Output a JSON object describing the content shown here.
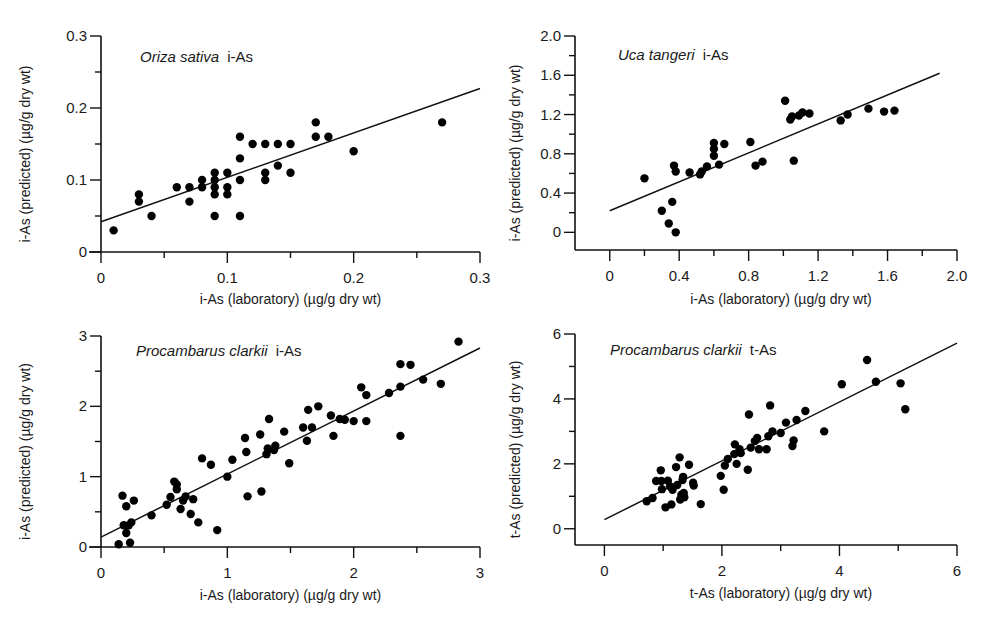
{
  "chart_data": [
    {
      "type": "scatter",
      "title": {
        "species": "Oriza sativa",
        "analyte": "i-As"
      },
      "xlabel": "i-As (laboratory) (µg/g dry wt)",
      "ylabel": "i-As  (predicted) (µg/g dry wt)",
      "xlim": [
        0,
        0.3
      ],
      "ylim": [
        0,
        0.3
      ],
      "xticks": [
        0,
        0.1,
        0.2,
        0.3
      ],
      "xtick_labels": [
        "0",
        "0.1",
        "0.2",
        "0.3"
      ],
      "xminor": [
        0.05,
        0.15,
        0.25
      ],
      "yticks": [
        0,
        0.1,
        0.2,
        0.3
      ],
      "ytick_labels": [
        "0",
        "0.1",
        "0.2",
        "0.3"
      ],
      "yminor": [
        0.05,
        0.15,
        0.25
      ],
      "grid": false,
      "points": [
        [
          0.01,
          0.03
        ],
        [
          0.03,
          0.08
        ],
        [
          0.03,
          0.07
        ],
        [
          0.04,
          0.05
        ],
        [
          0.06,
          0.09
        ],
        [
          0.07,
          0.09
        ],
        [
          0.07,
          0.07
        ],
        [
          0.08,
          0.1
        ],
        [
          0.08,
          0.09
        ],
        [
          0.09,
          0.11
        ],
        [
          0.09,
          0.1
        ],
        [
          0.09,
          0.09
        ],
        [
          0.09,
          0.08
        ],
        [
          0.09,
          0.05
        ],
        [
          0.1,
          0.11
        ],
        [
          0.1,
          0.09
        ],
        [
          0.1,
          0.08
        ],
        [
          0.11,
          0.16
        ],
        [
          0.11,
          0.13
        ],
        [
          0.11,
          0.1
        ],
        [
          0.11,
          0.05
        ],
        [
          0.12,
          0.15
        ],
        [
          0.13,
          0.15
        ],
        [
          0.13,
          0.11
        ],
        [
          0.13,
          0.1
        ],
        [
          0.14,
          0.15
        ],
        [
          0.14,
          0.12
        ],
        [
          0.15,
          0.15
        ],
        [
          0.15,
          0.11
        ],
        [
          0.17,
          0.18
        ],
        [
          0.17,
          0.16
        ],
        [
          0.18,
          0.16
        ],
        [
          0.2,
          0.14
        ],
        [
          0.27,
          0.18
        ]
      ],
      "fit_line": [
        [
          0,
          0.042
        ],
        [
          0.3,
          0.227
        ]
      ]
    },
    {
      "type": "scatter",
      "title": {
        "species": "Uca tangeri",
        "analyte": "i-As"
      },
      "xlabel": "i-As (laboratory) (µg/g dry wt)",
      "ylabel": "i-As (predicted) (µg/g dry wt)",
      "xlim": [
        -0.2,
        2.0
      ],
      "ylim": [
        -0.18,
        2.0
      ],
      "xticks": [
        0,
        0.4,
        0.8,
        1.2,
        1.6,
        2.0
      ],
      "xtick_labels": [
        "0",
        "0.4",
        "0.8",
        "1.2",
        "1.6",
        "2.0"
      ],
      "xminor": [
        0.2,
        0.6,
        1.0,
        1.4,
        1.8
      ],
      "yticks": [
        0,
        0.4,
        0.8,
        1.2,
        1.6,
        2.0
      ],
      "ytick_labels": [
        "0",
        "0.4",
        "0.8",
        "1.2",
        "1.6",
        "2.0"
      ],
      "yminor": [
        0.2,
        0.6,
        1.0,
        1.4,
        1.8
      ],
      "grid": false,
      "points": [
        [
          0.2,
          0.55
        ],
        [
          0.3,
          0.22
        ],
        [
          0.34,
          0.09
        ],
        [
          0.36,
          0.31
        ],
        [
          0.37,
          0.68
        ],
        [
          0.38,
          0.62
        ],
        [
          0.38,
          0.0
        ],
        [
          0.46,
          0.61
        ],
        [
          0.52,
          0.59
        ],
        [
          0.53,
          0.62
        ],
        [
          0.56,
          0.67
        ],
        [
          0.6,
          0.91
        ],
        [
          0.6,
          0.85
        ],
        [
          0.6,
          0.78
        ],
        [
          0.63,
          0.69
        ],
        [
          0.66,
          0.9
        ],
        [
          0.81,
          0.92
        ],
        [
          0.84,
          0.68
        ],
        [
          0.88,
          0.72
        ],
        [
          1.01,
          1.34
        ],
        [
          1.04,
          1.15
        ],
        [
          1.05,
          1.18
        ],
        [
          1.06,
          0.73
        ],
        [
          1.09,
          1.19
        ],
        [
          1.11,
          1.22
        ],
        [
          1.15,
          1.21
        ],
        [
          1.33,
          1.14
        ],
        [
          1.37,
          1.2
        ],
        [
          1.49,
          1.26
        ],
        [
          1.58,
          1.23
        ],
        [
          1.64,
          1.24
        ]
      ],
      "fit_line": [
        [
          0,
          0.22
        ],
        [
          1.9,
          1.62
        ]
      ]
    },
    {
      "type": "scatter",
      "title": {
        "species": "Procambarus clarkii",
        "analyte": "i-As"
      },
      "xlabel": "i-As (laboratory) (µg/g dry wt)",
      "ylabel": "i-As (predicted) (µg/g dry wt)",
      "xlim": [
        0,
        3
      ],
      "ylim": [
        0,
        3
      ],
      "xticks": [
        0,
        1,
        2,
        3
      ],
      "xtick_labels": [
        "0",
        "1",
        "2",
        "3"
      ],
      "xminor": [
        0.5,
        1.5,
        2.5
      ],
      "yticks": [
        0,
        1,
        2,
        3
      ],
      "ytick_labels": [
        "0",
        "1",
        "2",
        "3"
      ],
      "yminor": [
        0.5,
        1.5,
        2.5
      ],
      "grid": false,
      "points": [
        [
          0.14,
          0.04
        ],
        [
          0.17,
          0.73
        ],
        [
          0.18,
          0.31
        ],
        [
          0.2,
          0.58
        ],
        [
          0.2,
          0.2
        ],
        [
          0.22,
          0.31
        ],
        [
          0.23,
          0.06
        ],
        [
          0.24,
          0.35
        ],
        [
          0.26,
          0.66
        ],
        [
          0.4,
          0.45
        ],
        [
          0.52,
          0.6
        ],
        [
          0.55,
          0.71
        ],
        [
          0.58,
          0.93
        ],
        [
          0.6,
          0.89
        ],
        [
          0.6,
          0.82
        ],
        [
          0.63,
          0.54
        ],
        [
          0.65,
          0.66
        ],
        [
          0.67,
          0.72
        ],
        [
          0.71,
          0.47
        ],
        [
          0.73,
          0.68
        ],
        [
          0.77,
          0.35
        ],
        [
          0.8,
          1.26
        ],
        [
          0.87,
          1.17
        ],
        [
          0.92,
          0.24
        ],
        [
          1.0,
          1.0
        ],
        [
          1.04,
          1.24
        ],
        [
          1.14,
          1.55
        ],
        [
          1.15,
          1.35
        ],
        [
          1.16,
          0.72
        ],
        [
          1.26,
          1.6
        ],
        [
          1.27,
          0.79
        ],
        [
          1.31,
          1.32
        ],
        [
          1.32,
          1.4
        ],
        [
          1.33,
          1.82
        ],
        [
          1.37,
          1.38
        ],
        [
          1.38,
          1.44
        ],
        [
          1.45,
          1.64
        ],
        [
          1.49,
          1.19
        ],
        [
          1.6,
          1.7
        ],
        [
          1.63,
          1.51
        ],
        [
          1.64,
          1.95
        ],
        [
          1.67,
          1.7
        ],
        [
          1.72,
          2.0
        ],
        [
          1.82,
          1.87
        ],
        [
          1.84,
          1.58
        ],
        [
          1.89,
          1.82
        ],
        [
          1.93,
          1.81
        ],
        [
          2.0,
          1.79
        ],
        [
          2.06,
          2.27
        ],
        [
          2.1,
          2.16
        ],
        [
          2.1,
          1.79
        ],
        [
          2.28,
          2.19
        ],
        [
          2.37,
          2.6
        ],
        [
          2.37,
          2.28
        ],
        [
          2.37,
          1.58
        ],
        [
          2.45,
          2.59
        ],
        [
          2.55,
          2.38
        ],
        [
          2.69,
          2.32
        ],
        [
          2.83,
          2.92
        ]
      ],
      "fit_line": [
        [
          0,
          0.14
        ],
        [
          3,
          2.83
        ]
      ]
    },
    {
      "type": "scatter",
      "title": {
        "species": "Procambarus clarkii",
        "analyte": "t-As"
      },
      "xlabel": "t-As (laboratory) (µg/g dry wt)",
      "ylabel": "t-As (predicted) (µg/g dry wt)",
      "xlim": [
        -0.5,
        6
      ],
      "ylim": [
        -0.5,
        6
      ],
      "xticks": [
        0,
        2,
        4,
        6
      ],
      "xtick_labels": [
        "0",
        "2",
        "4",
        "6"
      ],
      "xminor": [
        1,
        3,
        5
      ],
      "yticks": [
        0,
        2,
        4,
        6
      ],
      "ytick_labels": [
        "0",
        "2",
        "4",
        "6"
      ],
      "yminor": [
        1,
        3,
        5
      ],
      "grid": false,
      "points": [
        [
          0.72,
          0.85
        ],
        [
          0.82,
          0.95
        ],
        [
          0.88,
          1.47
        ],
        [
          0.96,
          1.8
        ],
        [
          0.97,
          1.47
        ],
        [
          0.98,
          1.22
        ],
        [
          1.04,
          0.66
        ],
        [
          1.08,
          1.48
        ],
        [
          1.12,
          1.3
        ],
        [
          1.14,
          0.75
        ],
        [
          1.16,
          1.2
        ],
        [
          1.22,
          1.9
        ],
        [
          1.24,
          1.35
        ],
        [
          1.28,
          2.2
        ],
        [
          1.29,
          0.9
        ],
        [
          1.31,
          1.05
        ],
        [
          1.33,
          1.5
        ],
        [
          1.34,
          1.6
        ],
        [
          1.35,
          1.1
        ],
        [
          1.36,
          0.97
        ],
        [
          1.44,
          1.97
        ],
        [
          1.51,
          1.42
        ],
        [
          1.52,
          1.33
        ],
        [
          1.64,
          0.76
        ],
        [
          1.98,
          1.63
        ],
        [
          2.03,
          1.2
        ],
        [
          2.05,
          1.95
        ],
        [
          2.1,
          2.15
        ],
        [
          2.21,
          2.3
        ],
        [
          2.22,
          2.6
        ],
        [
          2.25,
          2.0
        ],
        [
          2.3,
          2.45
        ],
        [
          2.32,
          2.33
        ],
        [
          2.44,
          1.82
        ],
        [
          2.46,
          3.52
        ],
        [
          2.49,
          2.5
        ],
        [
          2.56,
          2.7
        ],
        [
          2.6,
          2.8
        ],
        [
          2.63,
          2.45
        ],
        [
          2.76,
          2.45
        ],
        [
          2.79,
          2.85
        ],
        [
          2.82,
          3.8
        ],
        [
          2.86,
          3.0
        ],
        [
          3.0,
          2.95
        ],
        [
          3.09,
          3.27
        ],
        [
          3.2,
          2.55
        ],
        [
          3.22,
          2.72
        ],
        [
          3.27,
          3.35
        ],
        [
          3.42,
          3.63
        ],
        [
          3.74,
          3.0
        ],
        [
          4.04,
          4.45
        ],
        [
          4.47,
          5.2
        ],
        [
          4.62,
          4.53
        ],
        [
          5.04,
          4.48
        ],
        [
          5.12,
          3.68
        ]
      ],
      "fit_line": [
        [
          0,
          0.28
        ],
        [
          6,
          5.72
        ]
      ]
    }
  ]
}
